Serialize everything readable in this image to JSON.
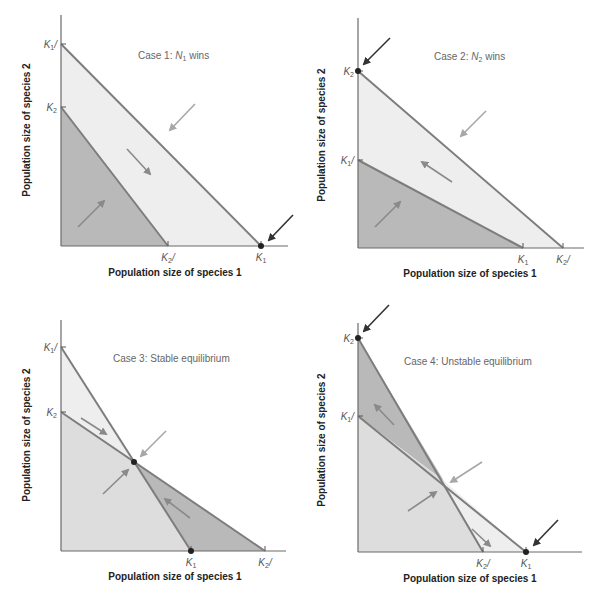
{
  "chart_data": [
    {
      "type": "diagram-phase-plane",
      "title": "Case 1: N1 wins",
      "title_parts": {
        "prefix": "Case 1: ",
        "var": "N",
        "sub": "1",
        "suffix": " wins"
      },
      "xlabel": "Population size of species 1",
      "ylabel": "Population size of species 2",
      "origin": [
        61,
        246
      ],
      "x_axis_end": 288,
      "y_axis_top": 15,
      "y_ticks": [
        {
          "label": "K",
          "sub": "1",
          "tail": "/",
          "y": 44
        },
        {
          "label": "K",
          "sub": "2",
          "tail": "",
          "y": 107
        }
      ],
      "x_ticks": [
        {
          "label": "K",
          "sub": "2",
          "tail": "/",
          "x": 168
        },
        {
          "label": "K",
          "sub": "1",
          "tail": "",
          "x": 261
        }
      ],
      "regions": [
        {
          "points": [
            [
              61,
              44
            ],
            [
              261,
              246
            ],
            [
              61,
              246
            ]
          ],
          "fill": "#eeeeee"
        },
        {
          "points": [
            [
              61,
              107
            ],
            [
              168,
              246
            ],
            [
              61,
              246
            ]
          ],
          "fill": "#b9b9b9"
        }
      ],
      "isoclines": [
        [
          [
            61,
            44
          ],
          [
            261,
            246
          ]
        ],
        [
          [
            61,
            107
          ],
          [
            168,
            246
          ]
        ]
      ],
      "arrows": [
        {
          "from": [
            78,
            227
          ],
          "to": [
            104,
            201
          ],
          "color": "#8a8a8a"
        },
        {
          "from": [
            127,
            149
          ],
          "to": [
            150,
            174
          ],
          "color": "#8a8a8a"
        },
        {
          "from": [
            195,
            104
          ],
          "to": [
            170,
            130
          ],
          "color": "#a8a8a8"
        },
        {
          "from": [
            293,
            215
          ],
          "to": [
            269,
            240
          ],
          "color": "#333333"
        }
      ],
      "dots": [
        [
          261,
          246
        ]
      ],
      "title_pos": [
        138,
        59
      ],
      "xlabel_pos": [
        175,
        276
      ],
      "ylabel_pos": [
        30,
        130
      ]
    },
    {
      "type": "diagram-phase-plane",
      "title": "Case 2: N2 wins",
      "title_parts": {
        "prefix": "Case 2: ",
        "var": "N",
        "sub": "2",
        "suffix": " wins"
      },
      "xlabel": "Population size of species 1",
      "ylabel": "Population size of species 2",
      "origin": [
        358,
        248
      ],
      "x_axis_end": 584,
      "y_axis_top": 18,
      "y_ticks": [
        {
          "label": "K",
          "sub": "2",
          "tail": "",
          "y": 71
        },
        {
          "label": "K",
          "sub": "1",
          "tail": "/",
          "y": 160
        }
      ],
      "x_ticks": [
        {
          "label": "K",
          "sub": "1",
          "tail": "",
          "x": 523
        },
        {
          "label": "K",
          "sub": "2",
          "tail": "/",
          "x": 563
        }
      ],
      "regions": [
        {
          "points": [
            [
              358,
              71
            ],
            [
              563,
              248
            ],
            [
              358,
              248
            ]
          ],
          "fill": "#eeeeee"
        },
        {
          "points": [
            [
              358,
              160
            ],
            [
              523,
              248
            ],
            [
              358,
              248
            ]
          ],
          "fill": "#b9b9b9"
        }
      ],
      "isoclines": [
        [
          [
            358,
            71
          ],
          [
            563,
            248
          ]
        ],
        [
          [
            358,
            160
          ],
          [
            523,
            248
          ]
        ]
      ],
      "arrows": [
        {
          "from": [
            375,
            227
          ],
          "to": [
            400,
            202
          ],
          "color": "#8a8a8a"
        },
        {
          "from": [
            452,
            182
          ],
          "to": [
            422,
            162
          ],
          "color": "#8a8a8a"
        },
        {
          "from": [
            486,
            111
          ],
          "to": [
            461,
            136
          ],
          "color": "#a8a8a8"
        },
        {
          "from": [
            390,
            38
          ],
          "to": [
            364,
            64
          ],
          "color": "#333333"
        }
      ],
      "dots": [
        [
          358,
          71
        ]
      ],
      "title_pos": [
        434,
        60
      ],
      "xlabel_pos": [
        470,
        277
      ],
      "ylabel_pos": [
        325,
        135
      ]
    },
    {
      "type": "diagram-phase-plane",
      "title": "Case 3: Stable equilibrium",
      "title_parts": {
        "prefix": "Case 3: Stable equilibrium",
        "var": "",
        "sub": "",
        "suffix": ""
      },
      "xlabel": "Population size of species 1",
      "ylabel": "Population size of species 2",
      "origin": [
        61,
        551
      ],
      "x_axis_end": 286,
      "y_axis_top": 320,
      "y_ticks": [
        {
          "label": "K",
          "sub": "1",
          "tail": "/",
          "y": 347
        },
        {
          "label": "K",
          "sub": "2",
          "tail": "",
          "y": 412
        }
      ],
      "x_ticks": [
        {
          "label": "K",
          "sub": "1",
          "tail": "",
          "x": 191
        },
        {
          "label": "K",
          "sub": "2",
          "tail": "/",
          "x": 265
        }
      ],
      "regions": [
        {
          "points": [
            [
              61,
              347
            ],
            [
              134,
              462
            ],
            [
              61,
              412
            ]
          ],
          "fill": "#eeeeee"
        },
        {
          "points": [
            [
              61,
              412
            ],
            [
              134,
              462
            ],
            [
              191,
              551
            ],
            [
              61,
              551
            ]
          ],
          "fill": "#dddddd"
        },
        {
          "points": [
            [
              134,
              462
            ],
            [
              265,
              551
            ],
            [
              191,
              551
            ]
          ],
          "fill": "#b9b9b9"
        }
      ],
      "isoclines": [
        [
          [
            61,
            347
          ],
          [
            191,
            551
          ]
        ],
        [
          [
            61,
            412
          ],
          [
            265,
            551
          ]
        ]
      ],
      "arrows": [
        {
          "from": [
            81,
            418
          ],
          "to": [
            106,
            434
          ],
          "color": "#8a8a8a"
        },
        {
          "from": [
            166,
            431
          ],
          "to": [
            141,
            456
          ],
          "color": "#a8a8a8"
        },
        {
          "from": [
            103,
            494
          ],
          "to": [
            128,
            470
          ],
          "color": "#8a8a8a"
        },
        {
          "from": [
            190,
            518
          ],
          "to": [
            165,
            499
          ],
          "color": "#8a8a8a"
        }
      ],
      "dots": [
        [
          134,
          462
        ],
        [
          191,
          551
        ]
      ],
      "title_pos": [
        113,
        362
      ],
      "xlabel_pos": [
        175,
        580
      ],
      "ylabel_pos": [
        30,
        435
      ]
    },
    {
      "type": "diagram-phase-plane",
      "title": "Case 4: Unstable equilibrium",
      "title_parts": {
        "prefix": "Case 4: Unstable equilibrium",
        "var": "",
        "sub": "",
        "suffix": ""
      },
      "xlabel": "Population size of species 1",
      "ylabel": "Population size of species 2",
      "origin": [
        358,
        552
      ],
      "x_axis_end": 582,
      "y_axis_top": 323,
      "y_ticks": [
        {
          "label": "K",
          "sub": "2",
          "tail": "",
          "y": 338
        },
        {
          "label": "K",
          "sub": "1",
          "tail": "/",
          "y": 416
        }
      ],
      "x_ticks": [
        {
          "label": "K",
          "sub": "2",
          "tail": "/",
          "x": 483
        },
        {
          "label": "K",
          "sub": "1",
          "tail": "",
          "x": 526
        }
      ],
      "regions": [
        {
          "points": [
            [
              358,
              338
            ],
            [
              444,
              481
            ],
            [
              358,
              416
            ]
          ],
          "fill": "#b9b9b9"
        },
        {
          "points": [
            [
              358,
              416
            ],
            [
              444,
              481
            ],
            [
              483,
              552
            ],
            [
              358,
              552
            ]
          ],
          "fill": "#dddddd"
        },
        {
          "points": [
            [
              444,
              481
            ],
            [
              526,
              552
            ],
            [
              483,
              552
            ]
          ],
          "fill": "#eeeeee"
        }
      ],
      "isoclines": [
        [
          [
            358,
            338
          ],
          [
            483,
            552
          ]
        ],
        [
          [
            358,
            416
          ],
          [
            526,
            552
          ]
        ]
      ],
      "arrows": [
        {
          "from": [
            394,
            425
          ],
          "to": [
            375,
            405
          ],
          "color": "#8a8a8a"
        },
        {
          "from": [
            482,
            462
          ],
          "to": [
            451,
            482
          ],
          "color": "#a8a8a8"
        },
        {
          "from": [
            408,
            511
          ],
          "to": [
            436,
            492
          ],
          "color": "#8a8a8a"
        },
        {
          "from": [
            472,
            529
          ],
          "to": [
            490,
            546
          ],
          "color": "#8a8a8a"
        },
        {
          "from": [
            389,
            305
          ],
          "to": [
            364,
            331
          ],
          "color": "#333333"
        },
        {
          "from": [
            558,
            520
          ],
          "to": [
            534,
            545
          ],
          "color": "#333333"
        }
      ],
      "dots": [
        [
          358,
          338
        ],
        [
          526,
          552
        ]
      ],
      "title_pos": [
        404,
        365
      ],
      "xlabel_pos": [
        470,
        582
      ],
      "ylabel_pos": [
        325,
        440
      ]
    }
  ]
}
